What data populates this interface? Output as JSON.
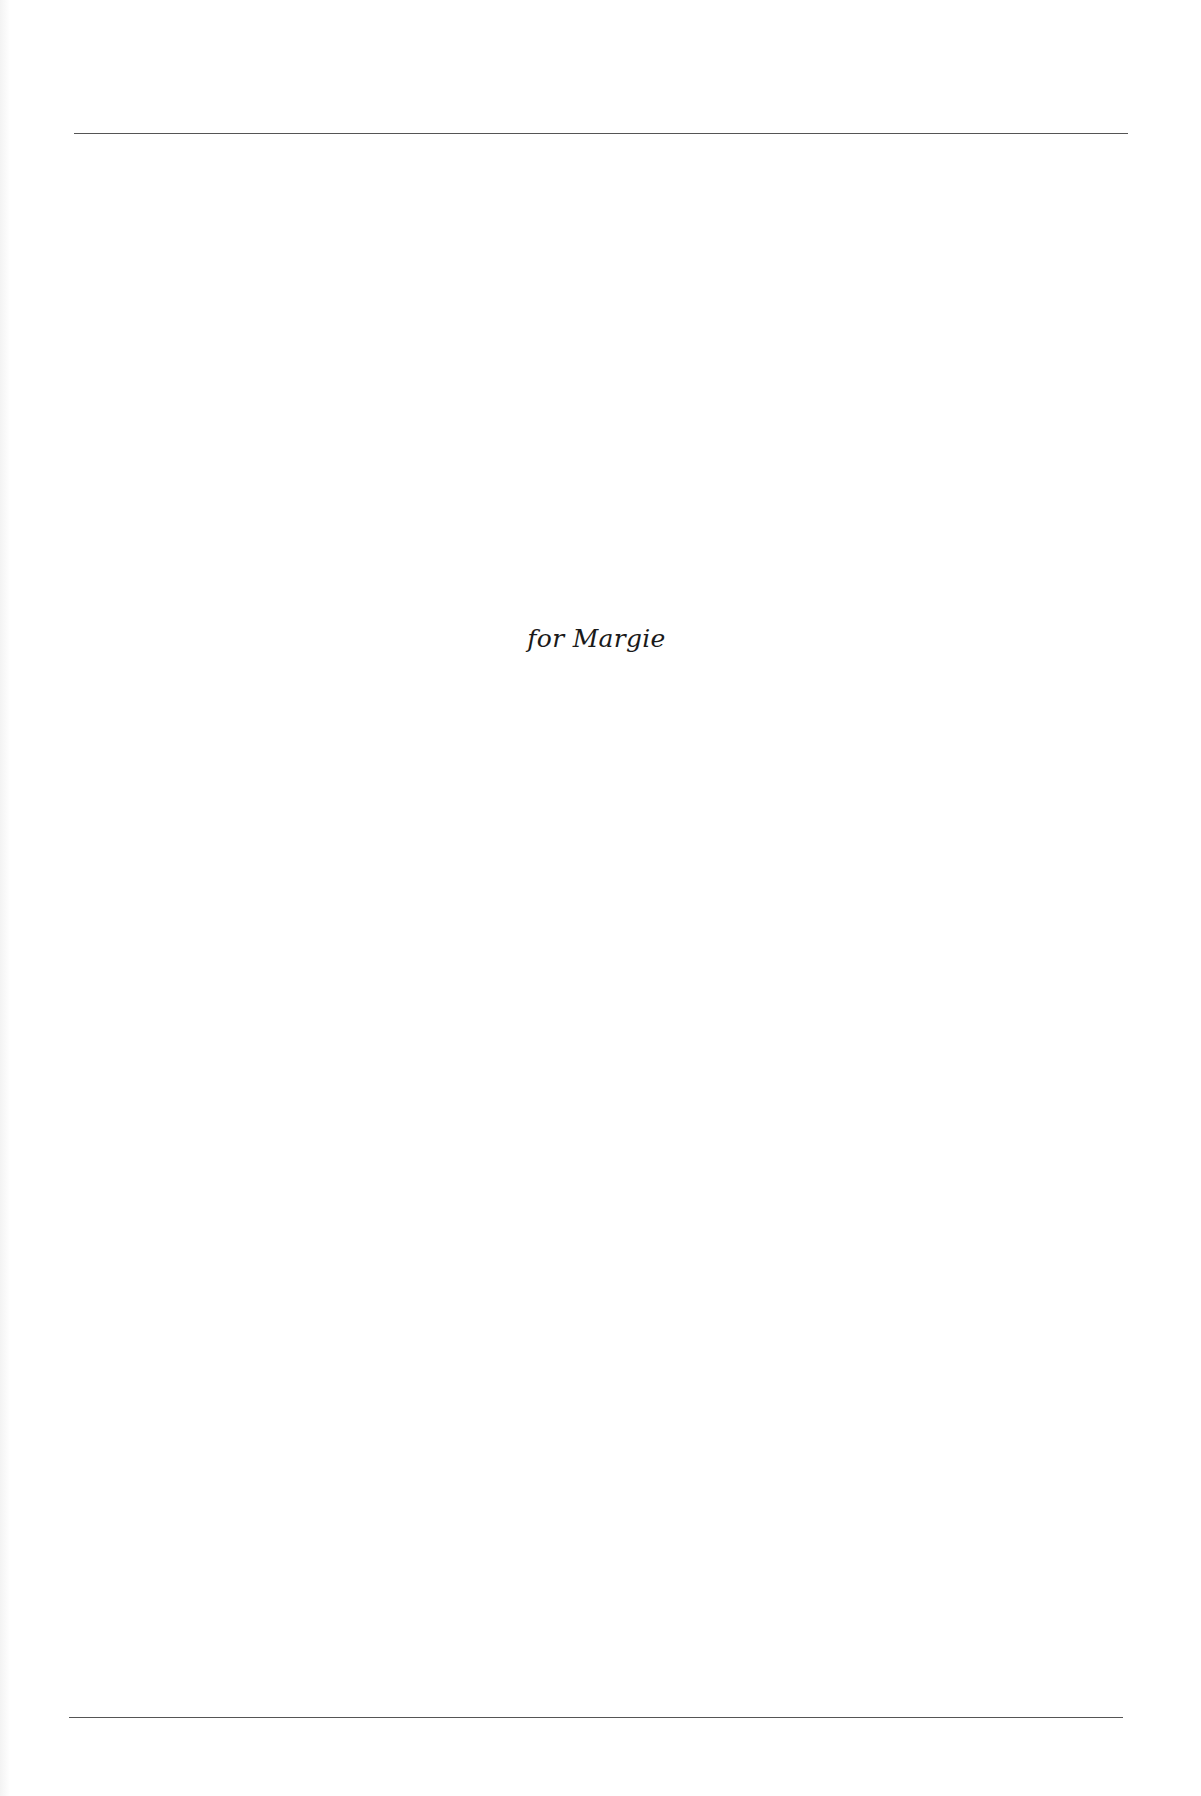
{
  "page": {
    "type": "dedication-page",
    "dedication_text": "for Margie"
  },
  "colors": {
    "background": "#ffffff",
    "text": "#1a1a1a",
    "rule": "#555555"
  }
}
